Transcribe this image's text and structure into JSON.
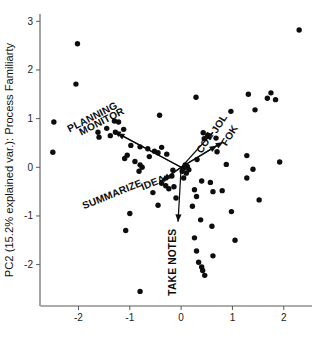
{
  "chart_data": {
    "type": "scatter",
    "title": "",
    "subtitle": "",
    "xlabel": "",
    "ylabel": "PC2 (15.2% explained var.): Process Familiarty",
    "xlim": [
      -2.75,
      2.55
    ],
    "ylim": [
      -2.85,
      3.15
    ],
    "xticks": [
      -2,
      -1,
      0,
      1,
      2
    ],
    "xticklabels": [
      "-2",
      "-1",
      "0",
      "1",
      "2"
    ],
    "yticks": [
      -2,
      -1,
      0,
      1,
      2,
      3
    ],
    "yticklabels": [
      "-2",
      "-1",
      "0",
      "1",
      "2",
      "3"
    ],
    "grid": false,
    "legend": null,
    "marker": "filled-circle",
    "marker_color": "#0d0d0d",
    "points": [
      [
        2.3,
        2.82
      ],
      [
        -2.02,
        2.54
      ],
      [
        -2.05,
        1.71
      ],
      [
        1.31,
        1.5
      ],
      [
        1.75,
        1.53
      ],
      [
        1.68,
        1.42
      ],
      [
        1.84,
        1.39
      ],
      [
        1.44,
        1.18
      ],
      [
        0.97,
        1.15
      ],
      [
        0.29,
        1.44
      ],
      [
        -0.42,
        1.07
      ],
      [
        -2.48,
        0.93
      ],
      [
        -2.5,
        0.31
      ],
      [
        -1.3,
        0.95
      ],
      [
        -1.22,
        0.93
      ],
      [
        -1.45,
        0.8
      ],
      [
        -1.12,
        0.78
      ],
      [
        -1.28,
        0.72
      ],
      [
        -1.62,
        0.72
      ],
      [
        -1.38,
        0.65
      ],
      [
        -1.6,
        0.62
      ],
      [
        0.43,
        0.71
      ],
      [
        0.52,
        0.66
      ],
      [
        0.45,
        0.59
      ],
      [
        0.68,
        0.6
      ],
      [
        1.28,
        0.24
      ],
      [
        -0.98,
        0.45
      ],
      [
        -0.8,
        0.42
      ],
      [
        -0.65,
        0.38
      ],
      [
        -0.52,
        0.33
      ],
      [
        -0.45,
        0.3
      ],
      [
        -0.38,
        0.41
      ],
      [
        -0.28,
        0.27
      ],
      [
        -1.05,
        0.25
      ],
      [
        -1.1,
        0.18
      ],
      [
        -0.9,
        0.12
      ],
      [
        -0.8,
        0.05
      ],
      [
        -0.76,
        0.0
      ],
      [
        -0.82,
        -0.08
      ],
      [
        0.31,
        0.16
      ],
      [
        0.88,
        0.06
      ],
      [
        1.4,
        -0.04
      ],
      [
        1.92,
        0.11
      ],
      [
        0.08,
        0.05
      ],
      [
        0.12,
        0.02
      ],
      [
        0.05,
        -0.02
      ],
      [
        0.15,
        -0.05
      ],
      [
        0.02,
        -0.08
      ],
      [
        0.1,
        -0.12
      ],
      [
        -0.16,
        -0.06
      ],
      [
        1.28,
        -0.22
      ],
      [
        0.4,
        -0.28
      ],
      [
        0.57,
        -0.31
      ],
      [
        -0.38,
        -0.33
      ],
      [
        -0.3,
        -0.38
      ],
      [
        -0.24,
        -0.44
      ],
      [
        -0.14,
        -0.4
      ],
      [
        0.26,
        -0.46
      ],
      [
        0.62,
        -0.5
      ],
      [
        0.8,
        -0.48
      ],
      [
        -0.1,
        -0.63
      ],
      [
        0.3,
        -0.6
      ],
      [
        1.52,
        -0.67
      ],
      [
        -0.45,
        -0.78
      ],
      [
        0.22,
        -0.8
      ],
      [
        -1.0,
        -0.95
      ],
      [
        0.98,
        -0.91
      ],
      [
        -1.08,
        -1.3
      ],
      [
        0.38,
        -1.08
      ],
      [
        0.6,
        -1.21
      ],
      [
        1.05,
        -1.5
      ],
      [
        0.26,
        -1.45
      ],
      [
        0.3,
        -1.72
      ],
      [
        0.62,
        -1.82
      ],
      [
        0.34,
        -1.95
      ],
      [
        0.4,
        -2.05
      ],
      [
        0.42,
        -2.12
      ],
      [
        0.46,
        -2.22
      ],
      [
        -0.8,
        -2.55
      ],
      [
        -0.18,
        -0.18
      ],
      [
        -0.55,
        -0.52
      ],
      [
        0.05,
        -0.22
      ],
      [
        -0.62,
        0.22
      ],
      [
        0.7,
        0.32
      ]
    ],
    "vectors": [
      {
        "label": "PLANNING",
        "x0": 0.0,
        "y0": 0.0,
        "x1": -1.32,
        "y1": 0.75,
        "label_x": -1.7,
        "label_y": 0.97,
        "label_rotation": -27
      },
      {
        "label": "MONITOR",
        "x0": 0.0,
        "y0": 0.0,
        "x1": -1.25,
        "y1": 0.7,
        "label_x": -1.52,
        "label_y": 0.88,
        "label_rotation": -27
      },
      {
        "label": "SUMMARIZE",
        "x0": 0.0,
        "y0": 0.0,
        "x1": -0.4,
        "y1": -0.3,
        "label_x": -1.32,
        "label_y": -0.62,
        "label_rotation": -22
      },
      {
        "label": "IDEA",
        "x0": 0.0,
        "y0": 0.0,
        "x1": -0.36,
        "y1": -0.27,
        "label_x": -0.52,
        "label_y": -0.38,
        "label_rotation": -22
      },
      {
        "label": "TAKE NOTES",
        "x0": 0.0,
        "y0": 0.0,
        "x1": -0.06,
        "y1": -1.12,
        "label_x": -0.1,
        "label_y": -1.95,
        "label_rotation": -90
      },
      {
        "label": "JOL",
        "x0": 0.0,
        "y0": 0.0,
        "x1": 0.62,
        "y1": 0.72,
        "label_x": 0.8,
        "label_y": 0.86,
        "label_rotation": -58
      },
      {
        "label": "FOK",
        "x0": 0.0,
        "y0": 0.0,
        "x1": 0.82,
        "y1": 0.52,
        "label_x": 1.0,
        "label_y": 0.62,
        "label_rotation": -58
      },
      {
        "label": "COE",
        "x0": 0.0,
        "y0": 0.0,
        "x1": 0.7,
        "y1": 0.45,
        "label_x": 0.52,
        "label_y": 0.47,
        "label_rotation": -58
      }
    ]
  }
}
